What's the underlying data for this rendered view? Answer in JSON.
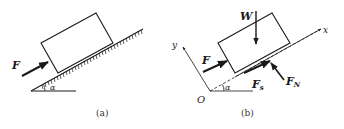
{
  "panels": [
    {
      "id": "a",
      "caption": "(a)",
      "labels": {
        "force": "F",
        "angle": "α"
      }
    },
    {
      "id": "b",
      "caption": "(b)",
      "labels": {
        "weight": "W",
        "force": "F",
        "friction": "F",
        "friction_sub": "s",
        "normal": "F",
        "normal_sub": "N",
        "x_axis": "x",
        "y_axis": "y",
        "origin": "O",
        "angle": "α"
      }
    }
  ],
  "colors": {
    "stroke": "#1a1a1a",
    "background": "#ffffff"
  }
}
